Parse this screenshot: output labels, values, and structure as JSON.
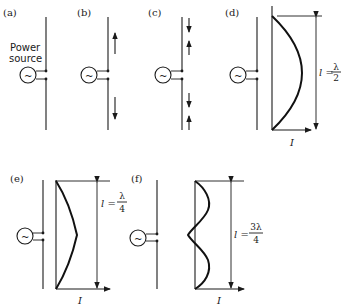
{
  "figure": {
    "panels": [
      {
        "id": "a",
        "label": "(a)",
        "description": "Power source feeding a straight vertical wire"
      },
      {
        "id": "b",
        "label": "(b)",
        "description": "Current arrows: up in upper half, down in lower half"
      },
      {
        "id": "c",
        "label": "(c)",
        "description": "Alternating current arrows along the wire"
      },
      {
        "id": "d",
        "label": "(d)",
        "description": "Half-wave current distribution",
        "length_label": "l =",
        "fraction_num": "λ",
        "fraction_den": "2",
        "current_label": "I"
      },
      {
        "id": "e",
        "label": "(e)",
        "description": "Quarter-wave current distribution",
        "length_label": "l =",
        "fraction_num": "λ",
        "fraction_den": "4",
        "current_label": "I"
      },
      {
        "id": "f",
        "label": "(f)",
        "description": "Three-quarter-wave current distribution",
        "length_label": "l =",
        "fraction_num": "3λ",
        "fraction_den": "4",
        "current_label": "I"
      }
    ],
    "power_source": {
      "line1": "Power",
      "line2": "source",
      "symbol": "~"
    }
  }
}
